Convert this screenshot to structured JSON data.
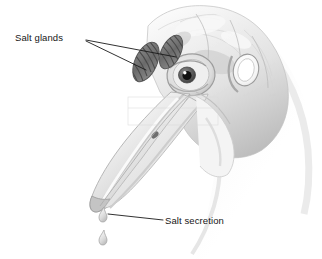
{
  "figure": {
    "kind": "anatomical-illustration",
    "style": "grayscale pencil/airbrush rendering on white background",
    "background_color": "#ffffff",
    "width": 322,
    "height": 259
  },
  "labels": {
    "salt_glands": "Salt glands",
    "salt_secretion": "Salt secretion"
  },
  "colors": {
    "text": "#161616",
    "leader_line": "#1a1a1a",
    "skull_light": "#f2f2f2",
    "skull_mid": "#d8d8d8",
    "skull_shadow": "#a9a9a9",
    "gland_dark": "#6e6e6e",
    "gland_stripe": "#4a4a4a",
    "eye_pupil": "#111111",
    "droplet": "#c9c9c9"
  },
  "parts": {
    "cranium": "cranium",
    "eye": "eye",
    "eye_socket": "orbit",
    "ear_opening": "ear opening",
    "upper_beak": "upper mandible with hooked tip",
    "lower_beak": "lower mandible",
    "nostril": "nostril",
    "neck": "neck",
    "gland_left": "left supraorbital salt gland",
    "gland_right": "right supraorbital salt gland",
    "droplet_upper": "salt droplet at beak tip",
    "droplet_lower": "falling salt droplet"
  },
  "leaders": {
    "glands_upper": "from 'Salt glands' text to upper salt gland",
    "glands_lower": "from 'Salt glands' text to lower salt gland",
    "secretion": "from 'Salt secretion' text to droplet at beak tip"
  }
}
